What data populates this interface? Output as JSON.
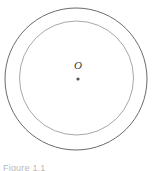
{
  "figure": {
    "center_label": "O",
    "caption": "Figure 1.1",
    "colors": {
      "background": "#ffffff",
      "outer_circle_stroke": "#6b6b6b",
      "inner_circle_stroke": "#a8a8a8",
      "center_dot": "#555555",
      "label_text": "#3a3a3a",
      "caption_text": "#b9b9b9"
    }
  },
  "chart_data": {
    "type": "diagram",
    "title": "Figure 1.1",
    "shapes": [
      {
        "name": "outer-circle",
        "type": "circle",
        "cx": 76,
        "cy": 79,
        "r": 71,
        "stroke": "#6b6b6b",
        "stroke_width": 1,
        "fill": "none"
      },
      {
        "name": "inner-circle",
        "type": "circle",
        "cx": 76.5,
        "cy": 78,
        "r": 57,
        "stroke": "#a8a8a8",
        "stroke_width": 1,
        "fill": "none"
      },
      {
        "name": "center-point",
        "type": "dot",
        "cx": 78,
        "cy": 79,
        "r": 1.6,
        "fill": "#555555",
        "label": "O"
      }
    ],
    "annotations": [
      {
        "text": "O",
        "x": 78,
        "y": 65,
        "style": "italic"
      }
    ],
    "xlabel": "",
    "ylabel": "",
    "grid": false,
    "legend": null
  }
}
